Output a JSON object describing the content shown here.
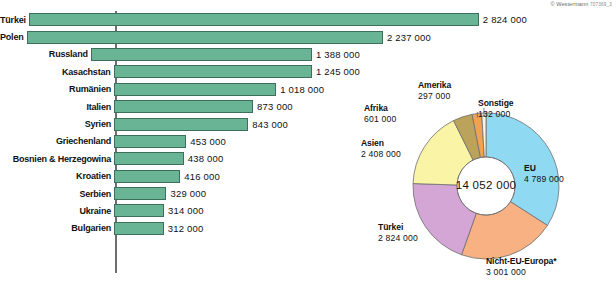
{
  "credit": {
    "text": "© Westermann",
    "code": "707369_3"
  },
  "chart_data": [
    {
      "type": "bar",
      "orientation": "horizontal",
      "title": "",
      "xlabel": "",
      "ylabel": "",
      "grid": false,
      "legend": "none",
      "xlim": [
        0,
        2824000
      ],
      "categories": [
        "Türkei",
        "Polen",
        "Russland",
        "Kasachstan",
        "Rumänien",
        "Italien",
        "Syrien",
        "Griechenland",
        "Bosnien & Herzegowina",
        "Kroatien",
        "Serbien",
        "Ukraine",
        "Bulgarien"
      ],
      "values": [
        2824000,
        2237000,
        1388000,
        1245000,
        1018000,
        873000,
        843000,
        453000,
        438000,
        416000,
        329000,
        314000,
        312000
      ],
      "value_labels": [
        "2 824 000",
        "2 237 000",
        "1 388 000",
        "1 245 000",
        "1 018 000",
        "873 000",
        "843 000",
        "453 000",
        "438 000",
        "416 000",
        "329 000",
        "314 000",
        "312 000"
      ],
      "bar_color": "#6ab496",
      "bar_border_color": "#3c6f5c"
    },
    {
      "type": "pie",
      "variant": "donut",
      "title": "",
      "center_label": "14 052 000",
      "total": 14052000,
      "legend": "outer-labels",
      "slices": [
        {
          "label": "EU",
          "value": 4789000,
          "value_label": "4 789 000",
          "color": "#8FD9F2"
        },
        {
          "label": "Nicht-EU-Europa*",
          "value": 3001000,
          "value_label": "3 001 000",
          "color": "#F7B183"
        },
        {
          "label": "Türkei",
          "value": 2824000,
          "value_label": "2 824 000",
          "color": "#D3A6D6"
        },
        {
          "label": "Asien",
          "value": 2408000,
          "value_label": "2 408 000",
          "color": "#FAF4A6"
        },
        {
          "label": "Afrika",
          "value": 601000,
          "value_label": "601 000",
          "color": "#BCA35B"
        },
        {
          "label": "Amerika",
          "value": 297000,
          "value_label": "297 000",
          "color": "#F0A250"
        },
        {
          "label": "Sonstige",
          "value": 132000,
          "value_label": "132 000",
          "color": "#FBF3D8"
        }
      ]
    }
  ]
}
